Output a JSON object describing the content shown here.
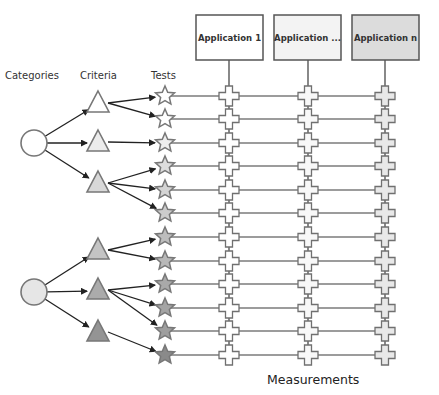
{
  "diagram": {
    "labels": {
      "categories": "Categories",
      "criteria": "Criteria",
      "tests": "Tests",
      "measurements": "Measurements"
    },
    "applications": [
      {
        "label": "Application 1",
        "x": 196,
        "fill": "#ffffff",
        "column_x": 229,
        "cross_fill": "#ffffff"
      },
      {
        "label": "Application ...",
        "x": 274,
        "fill": "#f3f3f3",
        "column_x": 308,
        "cross_fill": "#f8f8f8"
      },
      {
        "label": "Application n",
        "x": 352,
        "fill": "#dcdcdc",
        "column_x": 385,
        "cross_fill": "#e8e8e8"
      }
    ],
    "categories": [
      {
        "id": "category-1",
        "cx": 34,
        "cy": 143,
        "fill": "#ffffff"
      },
      {
        "id": "category-2",
        "cx": 34,
        "cy": 292,
        "fill": "#e6e6e6"
      }
    ],
    "criteria": [
      {
        "id": "criterion-1",
        "category": 0,
        "cx": 98,
        "cy": 102,
        "fill": "#ffffff",
        "tests": [
          0,
          1
        ]
      },
      {
        "id": "criterion-2",
        "category": 0,
        "cx": 98,
        "cy": 141,
        "fill": "#ececec",
        "tests": [
          2
        ]
      },
      {
        "id": "criterion-3",
        "category": 0,
        "cx": 98,
        "cy": 182,
        "fill": "#d8d8d8",
        "tests": [
          3,
          4,
          5
        ]
      },
      {
        "id": "criterion-4",
        "category": 1,
        "cx": 98,
        "cy": 249,
        "fill": "#c4c4c4",
        "tests": [
          6,
          7
        ]
      },
      {
        "id": "criterion-5",
        "category": 1,
        "cx": 98,
        "cy": 289,
        "fill": "#ababab",
        "tests": [
          8,
          9,
          10
        ]
      },
      {
        "id": "criterion-6",
        "category": 1,
        "cx": 98,
        "cy": 331,
        "fill": "#949494",
        "tests": [
          11
        ]
      }
    ],
    "tests": [
      {
        "cy": 96,
        "fill": "#ffffff"
      },
      {
        "cy": 119,
        "fill": "#ffffff"
      },
      {
        "cy": 143,
        "fill": "#eeeeee"
      },
      {
        "cy": 166,
        "fill": "#dddddd"
      },
      {
        "cy": 190,
        "fill": "#d4d4d4"
      },
      {
        "cy": 213,
        "fill": "#cccccc"
      },
      {
        "cy": 237,
        "fill": "#bdbdbd"
      },
      {
        "cy": 261,
        "fill": "#b8b8b8"
      },
      {
        "cy": 284,
        "fill": "#a9a9a9"
      },
      {
        "cy": 308,
        "fill": "#a4a4a4"
      },
      {
        "cy": 331,
        "fill": "#9e9e9e"
      },
      {
        "cy": 355,
        "fill": "#8a8a8a"
      }
    ],
    "colors": {
      "stroke": "#6b6b6b",
      "line": "#3a3a3a",
      "arrow": "#222222"
    }
  }
}
